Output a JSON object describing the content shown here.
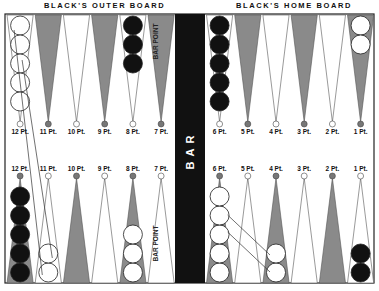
{
  "headers": {
    "left": "BLACK'S OUTER BOARD",
    "right": "BLACK'S HOME BOARD"
  },
  "bar": {
    "label": "BAR",
    "color": "#111111"
  },
  "bar_point_label": "BAR POINT",
  "colors": {
    "dark_point": "#8a8a8a",
    "light_point": "#ffffff",
    "black_checker": "#111111",
    "white_checker": "#ffffff",
    "outline": "#333333"
  },
  "top_points": [
    {
      "label": "12 Pt.",
      "shade": "light",
      "checkers": {
        "color": "white",
        "count": 5
      }
    },
    {
      "label": "11 Pt.",
      "shade": "dark",
      "checkers": null
    },
    {
      "label": "10 Pt.",
      "shade": "light",
      "checkers": null
    },
    {
      "label": "9 Pt.",
      "shade": "dark",
      "checkers": null
    },
    {
      "label": "8 Pt.",
      "shade": "light",
      "checkers": {
        "color": "black",
        "count": 3
      }
    },
    {
      "label": "7 Pt.",
      "shade": "dark",
      "checkers": null,
      "note": "BAR POINT"
    },
    {
      "label": "6 Pt.",
      "shade": "light",
      "checkers": {
        "color": "black",
        "count": 5
      }
    },
    {
      "label": "5 Pt.",
      "shade": "dark",
      "checkers": null
    },
    {
      "label": "4 Pt.",
      "shade": "light",
      "checkers": null
    },
    {
      "label": "3 Pt.",
      "shade": "dark",
      "checkers": null
    },
    {
      "label": "2 Pt.",
      "shade": "light",
      "checkers": null
    },
    {
      "label": "1 Pt.",
      "shade": "dark",
      "checkers": {
        "color": "white",
        "count": 2
      }
    }
  ],
  "bottom_points": [
    {
      "label": "12 Pt.",
      "shade": "dark",
      "checkers": {
        "color": "black",
        "count": 5
      }
    },
    {
      "label": "11 Pt.",
      "shade": "light",
      "checkers": {
        "color": "white",
        "count": 2
      }
    },
    {
      "label": "10 Pt.",
      "shade": "dark",
      "checkers": null
    },
    {
      "label": "9 Pt.",
      "shade": "light",
      "checkers": null
    },
    {
      "label": "8 Pt.",
      "shade": "dark",
      "checkers": {
        "color": "white",
        "count": 3
      }
    },
    {
      "label": "7 Pt.",
      "shade": "light",
      "checkers": null,
      "note": "BAR POINT"
    },
    {
      "label": "6 Pt.",
      "shade": "dark",
      "checkers": {
        "color": "white",
        "count": 5
      }
    },
    {
      "label": "5 Pt.",
      "shade": "light",
      "checkers": null
    },
    {
      "label": "4 Pt.",
      "shade": "dark",
      "checkers": {
        "color": "white",
        "count": 2
      }
    },
    {
      "label": "3 Pt.",
      "shade": "light",
      "checkers": null
    },
    {
      "label": "2 Pt.",
      "shade": "dark",
      "checkers": null
    },
    {
      "label": "1 Pt.",
      "shade": "light",
      "checkers": {
        "color": "black",
        "count": 2
      }
    }
  ],
  "moves": [
    {
      "from": "top 12 Pt.",
      "to": "bottom 11 Pt.",
      "count": 2
    },
    {
      "from": "bottom 6 Pt.",
      "to": "bottom 4 Pt.",
      "count": 2
    }
  ]
}
